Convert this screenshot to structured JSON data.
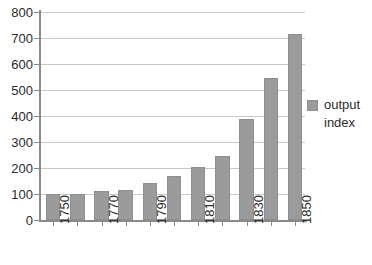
{
  "chart_data": {
    "type": "bar",
    "title": "",
    "xlabel": "",
    "ylabel": "",
    "categories": [
      "1750",
      "1760",
      "1770",
      "1780",
      "1790",
      "1800",
      "1810",
      "1820",
      "1830",
      "1840",
      "1850"
    ],
    "tick_labels_shown": [
      "1750",
      "1770",
      "1790",
      "1810",
      "1830",
      "1850"
    ],
    "values": [
      100,
      100,
      112,
      117,
      142,
      168,
      205,
      248,
      387,
      545,
      715
    ],
    "series": [
      {
        "name": "output index",
        "values": [
          100,
          100,
          112,
          117,
          142,
          168,
          205,
          248,
          387,
          545,
          715
        ]
      }
    ],
    "ylim": [
      0,
      800
    ],
    "y_ticks": [
      "0",
      "100",
      "200",
      "300",
      "400",
      "500",
      "600",
      "700",
      "800"
    ],
    "grid": true,
    "legend_position": "right",
    "legend": [
      "output index"
    ],
    "colors": {
      "bar": "#9b9b9b",
      "bar_border": "#8f8f8f",
      "gridline": "#c8c8c8",
      "axis": "#8a8a8a",
      "text": "#2b2b2b",
      "background": "#ffffff"
    }
  },
  "legend": {
    "entries": [
      {
        "label_line1": "output",
        "label_line2": "index"
      }
    ]
  }
}
